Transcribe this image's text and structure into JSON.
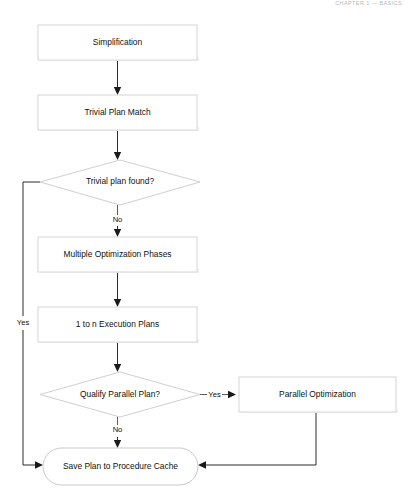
{
  "page": {
    "running_head": "CHAPTER 1 — BASICS",
    "background_color": "#ffffff",
    "width": 410,
    "height": 504
  },
  "diagram": {
    "type": "flowchart",
    "nodes": [
      {
        "id": "simplification",
        "label": "Simplification",
        "shape": "process",
        "x": 38,
        "y": 25,
        "w": 159,
        "h": 35
      },
      {
        "id": "trivial_match",
        "label": "Trivial Plan Match",
        "shape": "process",
        "x": 38,
        "y": 95,
        "w": 159,
        "h": 35
      },
      {
        "id": "trivial_found",
        "label": "Trivial plan found?",
        "shape": "decision",
        "x": 40,
        "y": 160,
        "w": 160,
        "h": 45
      },
      {
        "id": "multi_phases",
        "label": "Multiple Optimization Phases",
        "shape": "process",
        "x": 38,
        "y": 237,
        "w": 159,
        "h": 35
      },
      {
        "id": "exec_plans",
        "label": "1 to n Execution Plans",
        "shape": "process",
        "x": 38,
        "y": 307,
        "w": 159,
        "h": 35
      },
      {
        "id": "qualify_par",
        "label": "Qualify Parallel Plan?",
        "shape": "decision",
        "x": 40,
        "y": 372,
        "w": 160,
        "h": 45
      },
      {
        "id": "parallel_opt",
        "label": "Parallel Optimization",
        "shape": "process",
        "x": 239,
        "y": 377,
        "w": 157,
        "h": 35
      },
      {
        "id": "save_plan",
        "label": "Save Plan to Procedure Cache",
        "shape": "terminator",
        "x": 43,
        "y": 448,
        "w": 155,
        "h": 37
      }
    ],
    "edges": [
      {
        "id": "e1",
        "from": "simplification",
        "to": "trivial_match",
        "label": ""
      },
      {
        "id": "e2",
        "from": "trivial_match",
        "to": "trivial_found",
        "label": ""
      },
      {
        "id": "e3",
        "from": "trivial_found",
        "to": "multi_phases",
        "label": "No"
      },
      {
        "id": "e4",
        "from": "trivial_found",
        "to": "save_plan",
        "label": "Yes"
      },
      {
        "id": "e5",
        "from": "multi_phases",
        "to": "exec_plans",
        "label": ""
      },
      {
        "id": "e6",
        "from": "exec_plans",
        "to": "qualify_par",
        "label": ""
      },
      {
        "id": "e7",
        "from": "qualify_par",
        "to": "parallel_opt",
        "label": "Yes"
      },
      {
        "id": "e8",
        "from": "qualify_par",
        "to": "save_plan",
        "label": "No"
      },
      {
        "id": "e9",
        "from": "parallel_opt",
        "to": "save_plan",
        "label": ""
      }
    ],
    "labels": {
      "node_simplification": "Simplification",
      "node_trivial_match": "Trivial Plan Match",
      "node_trivial_found": "Trivial plan found?",
      "node_multi_phases": "Multiple Optimization Phases",
      "node_exec_plans": "1 to n Execution Plans",
      "node_qualify_par": "Qualify Parallel Plan?",
      "node_parallel_opt": "Parallel Optimization",
      "node_save_plan": "Save Plan to Procedure Cache",
      "edge_no_1": "No",
      "edge_yes_left": "Yes",
      "edge_yes_right": "Yes",
      "edge_no_2": "No"
    },
    "colors": {
      "node_fill": "#ffffff",
      "node_stroke": "#d6d6d6",
      "connector": "#2b2b2b",
      "text": "#101010"
    }
  }
}
